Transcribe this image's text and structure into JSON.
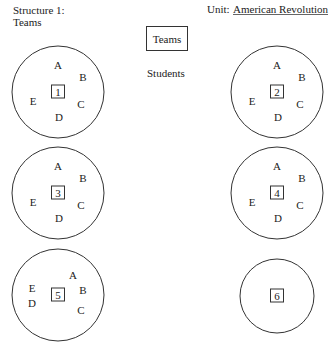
{
  "header": {
    "structure_label": "Structure 1:",
    "structure_name": "Teams",
    "unit_label": "Unit:",
    "unit_value": "American Revolution"
  },
  "legend": {
    "team_box_label": "Teams",
    "students_label": "Students"
  },
  "teams": [
    {
      "number": "1",
      "members": [
        "A",
        "B",
        "C",
        "D",
        "E"
      ],
      "layout": "standard"
    },
    {
      "number": "2",
      "members": [
        "A",
        "B",
        "C",
        "D",
        "E"
      ],
      "layout": "standard"
    },
    {
      "number": "3",
      "members": [
        "A",
        "B",
        "C",
        "D",
        "E"
      ],
      "layout": "standard"
    },
    {
      "number": "4",
      "members": [
        "A",
        "B",
        "C",
        "D",
        "E"
      ],
      "layout": "standard"
    },
    {
      "number": "5",
      "members": [
        "A",
        "B",
        "C",
        "D",
        "E"
      ],
      "layout": "alt"
    },
    {
      "number": "6",
      "members": [],
      "layout": "empty"
    }
  ]
}
